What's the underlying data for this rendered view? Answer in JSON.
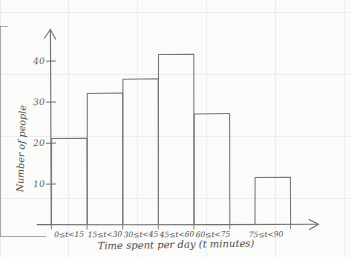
{
  "chart_data": {
    "type": "bar",
    "title": "",
    "subtitle": "",
    "xlabel": "Time spent per day (t minutes)",
    "ylabel": "Number of people",
    "categories": [
      "0≤t<15",
      "15≤t<30",
      "30≤t<45",
      "45≤t<60",
      "60≤t<75",
      "75≤t<90"
    ],
    "values": [
      21,
      32,
      35.5,
      41.5,
      27,
      11.5
    ],
    "ytick_labels": [
      "10",
      "20",
      "30",
      "40"
    ],
    "yticks": [
      10,
      20,
      30,
      40
    ],
    "ylim": [
      0,
      46
    ],
    "xlim": [
      0,
      6
    ],
    "grid": false,
    "legend": null,
    "style": {
      "bar_fill": "#fbfbf9",
      "bar_stroke": "#767676",
      "axis_color": "#6f6f6f",
      "background": "#fbfbf9",
      "text_color": "#4a4a4a"
    }
  },
  "axes": {
    "y_tick_0": "10",
    "y_tick_1": "20",
    "y_tick_2": "30",
    "y_tick_3": "40",
    "x_title": "Time spent per day (t minutes)",
    "y_title": "Number of people"
  },
  "categories_text": {
    "c0": "0≤t<15",
    "c1": "15≤t<30",
    "c2": "30≤t<45",
    "c3": "45≤t<60",
    "c4": "60≤t<75",
    "c5": "75≤t<90"
  }
}
